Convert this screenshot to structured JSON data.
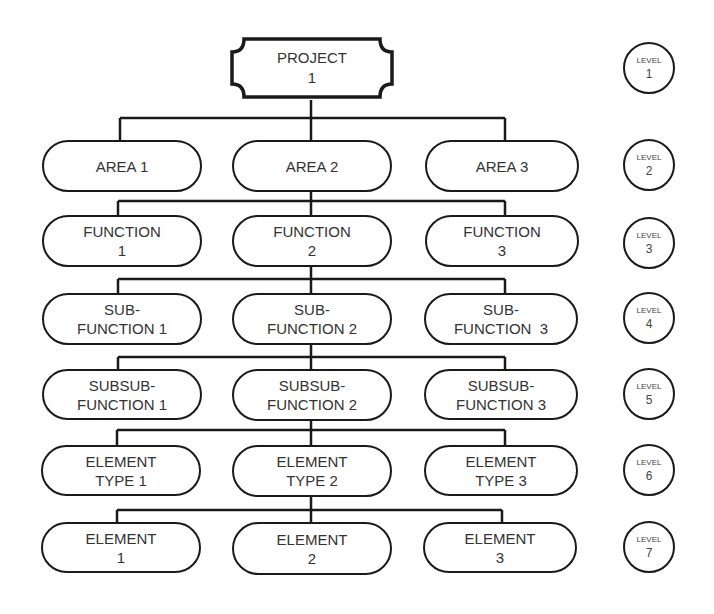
{
  "root": {
    "line1": "PROJECT",
    "line2": "1"
  },
  "rows": [
    {
      "nodes": [
        {
          "line1": "AREA 1",
          "line2": ""
        },
        {
          "line1": "AREA 2",
          "line2": ""
        },
        {
          "line1": "AREA 3",
          "line2": ""
        }
      ]
    },
    {
      "nodes": [
        {
          "line1": "FUNCTION",
          "line2": "1"
        },
        {
          "line1": "FUNCTION",
          "line2": "2"
        },
        {
          "line1": "FUNCTION",
          "line2": "3"
        }
      ]
    },
    {
      "nodes": [
        {
          "line1": "SUB-",
          "line2": "FUNCTION 1"
        },
        {
          "line1": "SUB-",
          "line2": "FUNCTION 2"
        },
        {
          "line1": "SUB-",
          "line2": "FUNCTION  3"
        }
      ]
    },
    {
      "nodes": [
        {
          "line1": "SUBSUB-",
          "line2": "FUNCTION 1"
        },
        {
          "line1": "SUBSUB-",
          "line2": "FUNCTION 2"
        },
        {
          "line1": "SUBSUB-",
          "line2": "FUNCTION 3"
        }
      ]
    },
    {
      "nodes": [
        {
          "line1": "ELEMENT",
          "line2": "TYPE 1"
        },
        {
          "line1": "ELEMENT",
          "line2": "TYPE 2"
        },
        {
          "line1": "ELEMENT",
          "line2": "TYPE 3"
        }
      ]
    },
    {
      "nodes": [
        {
          "line1": "ELEMENT",
          "line2": "1"
        },
        {
          "line1": "ELEMENT",
          "line2": "2"
        },
        {
          "line1": "ELEMENT",
          "line2": "3"
        }
      ]
    }
  ],
  "levels": [
    {
      "label": "LEVEL",
      "number": "1"
    },
    {
      "label": "LEVEL",
      "number": "2"
    },
    {
      "label": "LEVEL",
      "number": "3"
    },
    {
      "label": "LEVEL",
      "number": "4"
    },
    {
      "label": "LEVEL",
      "number": "5"
    },
    {
      "label": "LEVEL",
      "number": "6"
    },
    {
      "label": "LEVEL",
      "number": "7"
    }
  ],
  "colors": {
    "stroke": "#1a1a1a",
    "text": "#333333",
    "background": "#ffffff"
  }
}
